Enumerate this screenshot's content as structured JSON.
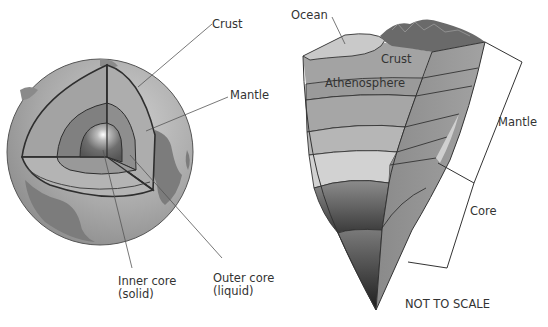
{
  "figure": {
    "left_panel": {
      "name": "Cutaway globe",
      "labels": {
        "crust": "Crust",
        "mantle": "Mantle",
        "inner_core_line1": "Inner core",
        "inner_core_line2": "(solid)",
        "outer_core_line1": "Outer core",
        "outer_core_line2": "(liquid)"
      }
    },
    "right_panel": {
      "name": "Layered wedge cross-section",
      "labels": {
        "ocean": "Ocean",
        "crust": "Crust",
        "asthenosphere": "Athenosphere",
        "mantle": "Mantle",
        "core": "Core",
        "note": "NOT TO SCALE"
      }
    },
    "colors": {
      "background": "#ffffff",
      "globe_surface": "#a8a8a8",
      "continents": "#7a7a7a",
      "mantle": "#a0a0a0",
      "outer_core": "#7e7e7e",
      "inner_core": "#5e5e5e",
      "outline": "#333333",
      "label_text": "#333333"
    }
  }
}
